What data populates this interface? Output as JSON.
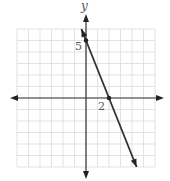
{
  "chart_data": {
    "type": "line",
    "title": "",
    "xlabel": "",
    "ylabel": "y",
    "xlim": [
      -6,
      6
    ],
    "ylim": [
      -6,
      6
    ],
    "grid": true,
    "grid_step": 1,
    "series": [
      {
        "name": "line",
        "equation": "y = -2.5x + 5",
        "points": [
          {
            "x": 0,
            "y": 5,
            "label": "5"
          },
          {
            "x": 2,
            "y": 0,
            "label": "2"
          }
        ],
        "extends": {
          "from": {
            "x": -0.4,
            "y": 6
          },
          "to": {
            "x": 4.4,
            "y": -6
          }
        }
      }
    ],
    "annotations": [
      {
        "text": "5",
        "at": "y-intercept"
      },
      {
        "text": "2",
        "at": "x-intercept"
      }
    ]
  },
  "labels": {
    "y_axis": "y",
    "y_intercept": "5",
    "x_intercept": "2"
  },
  "colors": {
    "grid": "#dcdcdc",
    "axis": "#333333",
    "line": "#333333",
    "text": "#555555"
  }
}
